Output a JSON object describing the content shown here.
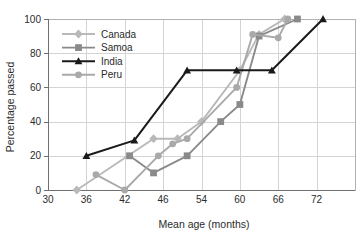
{
  "chart_data": {
    "type": "line",
    "title": "",
    "subtitle": "",
    "xlabel": "Mean age (months)",
    "ylabel": "Percentage passed",
    "xlim": [
      30,
      78
    ],
    "ylim": [
      0,
      100
    ],
    "x_ticks": [
      30,
      36,
      42,
      46,
      54,
      60,
      66,
      72
    ],
    "y_ticks": [
      0,
      20,
      40,
      60,
      80,
      100
    ],
    "grid": true,
    "legend_position": "upper-left-inside",
    "series": [
      {
        "name": "Canada",
        "color": "#b9b9b9",
        "marker": "diamond",
        "points": [
          [
            34.5,
            0
          ],
          [
            45.0,
            30
          ],
          [
            49.0,
            30
          ],
          [
            54.0,
            40
          ],
          [
            60.0,
            70
          ],
          [
            63.0,
            91
          ],
          [
            67.0,
            100
          ]
        ]
      },
      {
        "name": "Samoa",
        "color": "#8a8a8a",
        "marker": "square",
        "points": [
          [
            42.5,
            20
          ],
          [
            45.0,
            10
          ],
          [
            51.0,
            20
          ],
          [
            57.0,
            40
          ],
          [
            60.0,
            50
          ],
          [
            63.0,
            90
          ],
          [
            69.0,
            100
          ]
        ]
      },
      {
        "name": "India",
        "color": "#1a1a1a",
        "marker": "triangle",
        "points": [
          [
            36.0,
            20
          ],
          [
            43.0,
            29
          ],
          [
            51.0,
            70
          ],
          [
            59.5,
            70
          ],
          [
            65.0,
            70
          ],
          [
            73.0,
            100
          ]
        ]
      },
      {
        "name": "Peru",
        "color": "#a9a9a9",
        "marker": "circle",
        "points": [
          [
            37.5,
            9
          ],
          [
            42.0,
            0
          ],
          [
            45.5,
            20
          ],
          [
            48.0,
            27
          ],
          [
            51.0,
            30
          ],
          [
            59.5,
            60
          ],
          [
            62.0,
            91
          ],
          [
            66.0,
            89
          ],
          [
            67.5,
            100
          ]
        ]
      }
    ]
  },
  "legend": {
    "items": [
      {
        "label": "Canada"
      },
      {
        "label": "Samoa"
      },
      {
        "label": "India"
      },
      {
        "label": "Peru"
      }
    ]
  },
  "axes": {
    "x_title": "Mean age (months)",
    "y_title": "Percentage passed",
    "x_tick_labels": [
      "30",
      "36",
      "42",
      "46",
      "54",
      "60",
      "66",
      "72"
    ],
    "y_tick_labels": [
      "0",
      "20",
      "40",
      "60",
      "80",
      "100"
    ]
  }
}
